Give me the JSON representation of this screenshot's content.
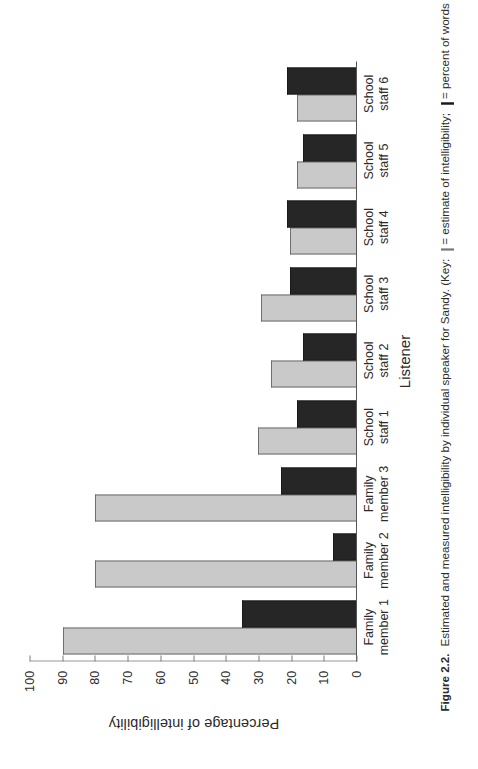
{
  "figure": {
    "number": "Figure 2.2.",
    "caption_part1": "Estimated and measured intelligibility by individual speaker for Sandy. (Key:",
    "caption_part2": "= estimate of intelligibility;",
    "caption_part3": "= percent of words identified correctly.)"
  },
  "axes": {
    "value_axis_title": "Percentage of intelligibility",
    "category_axis_title": "Listener",
    "value_ticks": [
      "100",
      "90",
      "80",
      "70",
      "60",
      "50",
      "40",
      "30",
      "20",
      "10",
      "0"
    ]
  },
  "legend": {
    "entries": [
      {
        "label": "= estimate of intelligibility;",
        "color": "#c9c9c9",
        "swatch": "gray-square-icon"
      },
      {
        "label": "= percent of words identified correctly.)",
        "color": "#262626",
        "swatch": "black-square-icon"
      }
    ]
  },
  "chart_data": {
    "type": "bar",
    "title": "Estimated and measured intelligibility by individual speaker for Sandy.",
    "xlabel": "Listener",
    "ylabel": "Percentage of intelligibility",
    "ylim": [
      0,
      100
    ],
    "ytick_step": 10,
    "grid": false,
    "legend_position": "below-figure-in-caption",
    "categories": [
      "Family\nmember 1",
      "Family\nmember 2",
      "Family\nmember 3",
      "School\nstaff 1",
      "School\nstaff 2",
      "School\nstaff 3",
      "School\nstaff 4",
      "School\nstaff 5",
      "School\nstaff 6"
    ],
    "series": [
      {
        "name": "estimate of intelligibility",
        "color": "#c9c9c9",
        "values": [
          90,
          80,
          80,
          30,
          26,
          29,
          20,
          18,
          18
        ]
      },
      {
        "name": "percent of words identified correctly",
        "color": "#262626",
        "values": [
          35,
          7,
          23,
          18,
          16,
          20,
          21,
          16,
          21
        ]
      }
    ]
  }
}
